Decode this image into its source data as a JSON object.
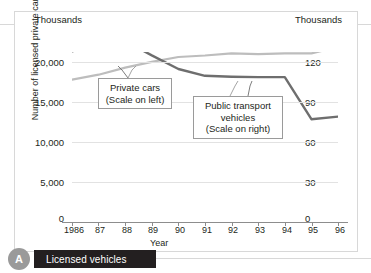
{
  "figure": {
    "caption_badge": "A",
    "caption_label": "Licensed vehicles",
    "unit_left": "Thousands",
    "unit_right": "Thousands"
  },
  "annotations": [
    {
      "id": "private",
      "line1": "Private cars",
      "line2": "(Scale on left)",
      "line3": ""
    },
    {
      "id": "public",
      "line1": "Public transport",
      "line2": "vehicles",
      "line3": "(Scale on right)"
    }
  ],
  "colors": {
    "private_cars_line": "#6e6e6e",
    "public_transport_line": "#bdbdbd",
    "gridline": "#e2e2e2",
    "axis": "#8d8d8d",
    "caption_bar": "#231f20",
    "caption_badge": "#9a9a9a",
    "frame": "#d8d8d8",
    "text": "#231f20"
  },
  "chart_data": {
    "type": "line",
    "title": "Licensed vehicles",
    "xlabel": "Year",
    "grid": true,
    "legend_position": "inline-callouts",
    "x": [
      "1986",
      "87",
      "88",
      "89",
      "90",
      "91",
      "92",
      "93",
      "94",
      "95",
      "96"
    ],
    "xtick_labels": [
      "1986",
      "87",
      "88",
      "89",
      "90",
      "91",
      "92",
      "93",
      "94",
      "95",
      "96"
    ],
    "left_axis": {
      "label": "Number of licensed private cars",
      "unit": "Thousands",
      "ylim": [
        0,
        20000
      ],
      "ticks": [
        0,
        5000,
        10000,
        15000,
        20000
      ],
      "tick_labels": [
        "0",
        "5,000",
        "10,000",
        "15,000",
        "20,000"
      ]
    },
    "right_axis": {
      "label": "Number of licensed public transport vehicles",
      "unit": "Thousands",
      "ylim": [
        0,
        120
      ],
      "ticks": [
        0,
        30,
        60,
        90,
        120
      ],
      "tick_labels": [
        "0",
        "30",
        "60",
        "90",
        "120"
      ]
    },
    "series": [
      {
        "name": "Private cars",
        "axis": "left",
        "color": "#6e6e6e",
        "scale_note": "(Scale on left)",
        "values": [
          20100,
          20700,
          21300,
          19600,
          18000,
          17200,
          17100,
          17050,
          17050,
          12100,
          12400
        ]
      },
      {
        "name": "Public transport vehicles",
        "axis": "right",
        "color": "#bdbdbd",
        "scale_note": "(Scale on right)",
        "values": [
          100.5,
          104.0,
          109.0,
          113.0,
          116.5,
          117.5,
          119.0,
          118.5,
          119.0,
          119.0,
          123.5
        ]
      }
    ]
  }
}
